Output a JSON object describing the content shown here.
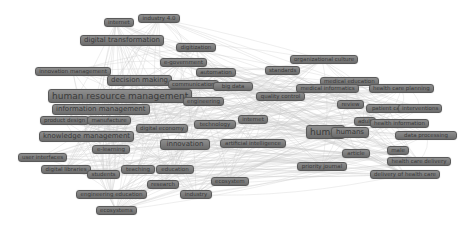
{
  "diagram": {
    "type": "keyword co-occurrence network",
    "colors": {
      "node_fill": "#7a7a7a",
      "node_border": "#5a5a5a",
      "label": "#3a3a3a",
      "edge": "#c8c8c8",
      "background": "#ffffff"
    },
    "nodes": [
      {
        "id": "internet-top",
        "label": "internet",
        "x": 104,
        "y": 18,
        "w": 24,
        "size": "s"
      },
      {
        "id": "industry-4",
        "label": "industry 4.0",
        "x": 138,
        "y": 14,
        "w": 42,
        "size": "s"
      },
      {
        "id": "digital-transformation",
        "label": "digital transformation",
        "x": 80,
        "y": 35,
        "w": 74,
        "size": "m"
      },
      {
        "id": "digitization",
        "label": "digitization",
        "x": 176,
        "y": 43,
        "w": 40,
        "size": "s"
      },
      {
        "id": "e-learning-top",
        "label": "e-government",
        "x": 160,
        "y": 58,
        "w": 42,
        "size": "s"
      },
      {
        "id": "automation",
        "label": "automation",
        "x": 196,
        "y": 68,
        "w": 40,
        "size": "s"
      },
      {
        "id": "innovation-management",
        "label": "innovation management",
        "x": 35,
        "y": 67,
        "w": 76,
        "size": "s"
      },
      {
        "id": "decision-making",
        "label": "decision making",
        "x": 107,
        "y": 75,
        "w": 62,
        "size": "m"
      },
      {
        "id": "communication",
        "label": "communication",
        "x": 168,
        "y": 80,
        "w": 48,
        "size": "s"
      },
      {
        "id": "blockchain",
        "label": "big data",
        "x": 213,
        "y": 82,
        "w": 40,
        "size": "s"
      },
      {
        "id": "human-resource-management",
        "label": "human resource management",
        "x": 48,
        "y": 89,
        "w": 126,
        "size": "l"
      },
      {
        "id": "information-management",
        "label": "information management",
        "x": 52,
        "y": 104,
        "w": 93,
        "size": "m"
      },
      {
        "id": "product-design",
        "label": "product design",
        "x": 40,
        "y": 116,
        "w": 48,
        "size": "s"
      },
      {
        "id": "manufacture",
        "label": "manufacture",
        "x": 87,
        "y": 116,
        "w": 44,
        "size": "s"
      },
      {
        "id": "engineering-top",
        "label": "engineering",
        "x": 183,
        "y": 97,
        "w": 38,
        "size": "s"
      },
      {
        "id": "knowledge-management",
        "label": "knowledge management",
        "x": 39,
        "y": 131,
        "w": 90,
        "size": "m"
      },
      {
        "id": "digital-economy",
        "label": "digital economy",
        "x": 136,
        "y": 124,
        "w": 52,
        "size": "s"
      },
      {
        "id": "technology",
        "label": "technology",
        "x": 194,
        "y": 120,
        "w": 42,
        "size": "s"
      },
      {
        "id": "internet",
        "label": "internet",
        "x": 238,
        "y": 115,
        "w": 30,
        "size": "s"
      },
      {
        "id": "e-learning",
        "label": "e-learning",
        "x": 92,
        "y": 145,
        "w": 38,
        "size": "s"
      },
      {
        "id": "innovation",
        "label": "innovation",
        "x": 160,
        "y": 139,
        "w": 50,
        "size": "m"
      },
      {
        "id": "artificial-intelligence",
        "label": "artificial intelligence",
        "x": 220,
        "y": 139,
        "w": 66,
        "size": "s"
      },
      {
        "id": "user-interfaces",
        "label": "user interfaces",
        "x": 18,
        "y": 153,
        "w": 46,
        "size": "s"
      },
      {
        "id": "digital-libraries",
        "label": "digital libraries",
        "x": 41,
        "y": 165,
        "w": 50,
        "size": "s"
      },
      {
        "id": "students",
        "label": "students",
        "x": 87,
        "y": 170,
        "w": 33,
        "size": "s"
      },
      {
        "id": "teaching",
        "label": "teaching",
        "x": 121,
        "y": 165,
        "w": 34,
        "size": "s"
      },
      {
        "id": "education",
        "label": "education",
        "x": 156,
        "y": 165,
        "w": 38,
        "size": "s"
      },
      {
        "id": "research",
        "label": "research",
        "x": 147,
        "y": 180,
        "w": 32,
        "size": "s"
      },
      {
        "id": "ecosystem",
        "label": "ecosystem",
        "x": 211,
        "y": 177,
        "w": 37,
        "size": "s"
      },
      {
        "id": "engineering-education",
        "label": "engineering education",
        "x": 76,
        "y": 190,
        "w": 71,
        "size": "s"
      },
      {
        "id": "industry",
        "label": "industry",
        "x": 180,
        "y": 190,
        "w": 32,
        "size": "s"
      },
      {
        "id": "ecosystems",
        "label": "ecosystems",
        "x": 96,
        "y": 206,
        "w": 40,
        "size": "s"
      },
      {
        "id": "organizational-culture",
        "label": "organizational culture",
        "x": 290,
        "y": 55,
        "w": 64,
        "size": "s"
      },
      {
        "id": "standards",
        "label": "standards",
        "x": 265,
        "y": 66,
        "w": 34,
        "size": "s"
      },
      {
        "id": "medical-education",
        "label": "medical education",
        "x": 320,
        "y": 77,
        "w": 57,
        "size": "s"
      },
      {
        "id": "medical-informatics",
        "label": "medical informatics",
        "x": 296,
        "y": 84,
        "w": 63,
        "size": "s"
      },
      {
        "id": "health-care-planning",
        "label": "health care planning",
        "x": 369,
        "y": 84,
        "w": 64,
        "size": "s"
      },
      {
        "id": "quality-control",
        "label": "quality control",
        "x": 256,
        "y": 92,
        "w": 49,
        "size": "s"
      },
      {
        "id": "review",
        "label": "review",
        "x": 337,
        "y": 100,
        "w": 27,
        "size": "s"
      },
      {
        "id": "patient-care",
        "label": "patient care",
        "x": 366,
        "y": 104,
        "w": 45,
        "size": "s"
      },
      {
        "id": "interventions",
        "label": "interventions",
        "x": 398,
        "y": 104,
        "w": 44,
        "size": "s"
      },
      {
        "id": "adult",
        "label": "adult",
        "x": 354,
        "y": 117,
        "w": 22,
        "size": "s"
      },
      {
        "id": "health-information",
        "label": "health information",
        "x": 370,
        "y": 119,
        "w": 58,
        "size": "s"
      },
      {
        "id": "human",
        "label": "human",
        "x": 306,
        "y": 125,
        "w": 30,
        "size": "l"
      },
      {
        "id": "humans",
        "label": "humans",
        "x": 331,
        "y": 127,
        "w": 38,
        "size": "m"
      },
      {
        "id": "data-processing",
        "label": "data processing",
        "x": 395,
        "y": 131,
        "w": 62,
        "size": "s"
      },
      {
        "id": "article",
        "label": "article",
        "x": 342,
        "y": 149,
        "w": 28,
        "size": "s"
      },
      {
        "id": "male",
        "label": "male",
        "x": 387,
        "y": 146,
        "w": 22,
        "size": "s"
      },
      {
        "id": "priority-journal",
        "label": "priority journal",
        "x": 297,
        "y": 162,
        "w": 50,
        "size": "s"
      },
      {
        "id": "health-care-delivery",
        "label": "health care delivery",
        "x": 387,
        "y": 157,
        "w": 64,
        "size": "s"
      },
      {
        "id": "delivery-of-health-care",
        "label": "delivery of health care",
        "x": 370,
        "y": 170,
        "w": 70,
        "size": "s"
      }
    ]
  }
}
